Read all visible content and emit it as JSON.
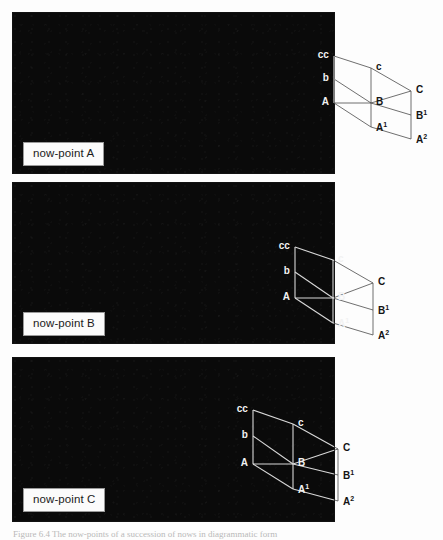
{
  "figure": {
    "caption": "Figure 6.4  The now-points of a succession of nows in diagrammatic form"
  },
  "panels": [
    {
      "id": "panel-a",
      "now_label": "now-point A",
      "diagram": {
        "origin_x": 334,
        "origin_y": 103,
        "vertices": [
          {
            "name": "cc",
            "label": "cc",
            "sup": "",
            "x": 334,
            "y": 56,
            "anchor": "right",
            "color": "white"
          },
          {
            "name": "c",
            "label": "c",
            "sup": "",
            "x": 371,
            "y": 68,
            "anchor": "left",
            "color": "black"
          },
          {
            "name": "C",
            "label": "C",
            "sup": "",
            "x": 411,
            "y": 91,
            "anchor": "left",
            "color": "black"
          },
          {
            "name": "b",
            "label": "b",
            "sup": "",
            "x": 334,
            "y": 79,
            "anchor": "right",
            "color": "white"
          },
          {
            "name": "B",
            "label": "B",
            "sup": "",
            "x": 371,
            "y": 103,
            "anchor": "left",
            "color": "black"
          },
          {
            "name": "B1",
            "label": "B",
            "sup": "1",
            "x": 411,
            "y": 115,
            "anchor": "left",
            "color": "black"
          },
          {
            "name": "A",
            "label": "A",
            "sup": "",
            "x": 334,
            "y": 103,
            "anchor": "right",
            "color": "white"
          },
          {
            "name": "A1",
            "label": "A",
            "sup": "1",
            "x": 371,
            "y": 127,
            "anchor": "left",
            "color": "black"
          },
          {
            "name": "A2",
            "label": "A",
            "sup": "2",
            "x": 411,
            "y": 139,
            "anchor": "left",
            "color": "black"
          }
        ]
      }
    },
    {
      "id": "panel-b",
      "now_label": "now-point B",
      "diagram": {
        "origin_x": 295,
        "origin_y": 298,
        "vertices": [
          {
            "name": "cc",
            "label": "cc",
            "sup": "",
            "x": 295,
            "y": 247,
            "anchor": "right",
            "color": "white"
          },
          {
            "name": "c",
            "label": "c",
            "sup": "",
            "x": 333,
            "y": 260,
            "anchor": "left",
            "color": "white"
          },
          {
            "name": "C",
            "label": "C",
            "sup": "",
            "x": 373,
            "y": 283,
            "anchor": "left",
            "color": "black"
          },
          {
            "name": "b",
            "label": "b",
            "sup": "",
            "x": 295,
            "y": 272,
            "anchor": "right",
            "color": "white"
          },
          {
            "name": "B",
            "label": "B",
            "sup": "",
            "x": 333,
            "y": 298,
            "anchor": "left",
            "color": "white"
          },
          {
            "name": "B1",
            "label": "B",
            "sup": "1",
            "x": 373,
            "y": 310,
            "anchor": "left",
            "color": "black"
          },
          {
            "name": "A",
            "label": "A",
            "sup": "",
            "x": 295,
            "y": 298,
            "anchor": "right",
            "color": "white"
          },
          {
            "name": "A1",
            "label": "A",
            "sup": "1",
            "x": 333,
            "y": 323,
            "anchor": "left",
            "color": "white"
          },
          {
            "name": "A2",
            "label": "A",
            "sup": "2",
            "x": 373,
            "y": 335,
            "anchor": "left",
            "color": "black"
          }
        ]
      }
    },
    {
      "id": "panel-c",
      "now_label": "now-point C",
      "diagram": {
        "origin_x": 253,
        "origin_y": 464,
        "vertices": [
          {
            "name": "cc",
            "label": "cc",
            "sup": "",
            "x": 253,
            "y": 410,
            "anchor": "right",
            "color": "white"
          },
          {
            "name": "c",
            "label": "c",
            "sup": "",
            "x": 293,
            "y": 424,
            "anchor": "left",
            "color": "white"
          },
          {
            "name": "C",
            "label": "C",
            "sup": "",
            "x": 338,
            "y": 449,
            "anchor": "left",
            "color": "black"
          },
          {
            "name": "b",
            "label": "b",
            "sup": "",
            "x": 253,
            "y": 436,
            "anchor": "right",
            "color": "white"
          },
          {
            "name": "B",
            "label": "B",
            "sup": "",
            "x": 293,
            "y": 464,
            "anchor": "left",
            "color": "white"
          },
          {
            "name": "B1",
            "label": "B",
            "sup": "1",
            "x": 338,
            "y": 475,
            "anchor": "left",
            "color": "black"
          },
          {
            "name": "A",
            "label": "A",
            "sup": "",
            "x": 253,
            "y": 464,
            "anchor": "right",
            "color": "white"
          },
          {
            "name": "A1",
            "label": "A",
            "sup": "1",
            "x": 293,
            "y": 489,
            "anchor": "left",
            "color": "white"
          },
          {
            "name": "A2",
            "label": "A",
            "sup": "2",
            "x": 338,
            "y": 501,
            "anchor": "left",
            "color": "black"
          }
        ]
      }
    }
  ],
  "colors": {
    "plate": "#0a0a0a",
    "page": "#fdfdfd",
    "line_on_black": "#d8d8d8",
    "line_on_white": "#4a4a4a",
    "label_box_border": "#9a9a9a"
  }
}
